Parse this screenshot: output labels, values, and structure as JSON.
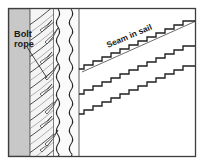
{
  "figure": {
    "kind": "technical-illustration",
    "background_color": "#ffffff",
    "frame": {
      "border_color": "#3d3d3d",
      "x": 8,
      "y": 8,
      "width": 188,
      "height": 149
    },
    "labels": [
      {
        "id": "bolt-rope",
        "line1": "Bolt",
        "line2": "rope",
        "x": 14,
        "y": 38,
        "color": "#1a1a1a",
        "leader": {
          "x1": 28,
          "y1": 48,
          "x2": 46,
          "y2": 76
        }
      },
      {
        "id": "seam-in-sail",
        "text": "Seam in sail",
        "x": 108,
        "y": 46,
        "rotation_deg": -23,
        "color": "#1a1a1a"
      }
    ],
    "panels": {
      "tabling": {
        "name": "gray-tabling-panel",
        "fill": "#c8c8c8",
        "stroke": "#6e6e6e",
        "x": 9,
        "y": 9,
        "width": 21,
        "height": 147
      },
      "rope_band": {
        "name": "braided-rope-band",
        "fill": "#f2f2f2",
        "x": 30,
        "y": 9,
        "width": 24,
        "height": 147,
        "strand_color": "#2b2b2b",
        "strand_count": 9,
        "strand_angle_deg": 58
      },
      "sail_cloth": {
        "name": "sail-cloth-panel",
        "fill": "#ffffff",
        "x": 79,
        "y": 9,
        "width": 116,
        "height": 147
      }
    },
    "vertical_rules": [
      {
        "name": "tabling-edge",
        "x": 30,
        "color": "#4a4a4a"
      },
      {
        "name": "rope-inner-edge",
        "x": 53,
        "color": "#4a4a4a"
      },
      {
        "name": "sail-fold-edge",
        "x": 79,
        "color": "#4a4a4a"
      }
    ],
    "vertical_stitch_lines": [
      {
        "name": "zigzag-stitch-left",
        "x": 58,
        "color": "#2b2b2b",
        "amplitude": 3.2,
        "period": 9
      },
      {
        "name": "zigzag-stitch-right",
        "x": 71,
        "color": "#2b2b2b",
        "amplitude": 3.4,
        "period": 9
      }
    ],
    "seam_line": {
      "name": "diagonal-seam-line",
      "color": "#3a3a3a",
      "x1": 82,
      "y1": 72,
      "x2": 195,
      "y2": 22
    },
    "stitch_rows": [
      {
        "name": "stitch-row-top",
        "start_x": 79,
        "start_y": 69,
        "end_x": 195,
        "end_y": 22,
        "steps": 13
      },
      {
        "name": "stitch-row-middle",
        "start_x": 79,
        "start_y": 94,
        "end_x": 195,
        "end_y": 47,
        "steps": 13
      },
      {
        "name": "stitch-row-bottom",
        "start_x": 79,
        "start_y": 114,
        "end_x": 195,
        "end_y": 67,
        "steps": 13
      }
    ]
  }
}
